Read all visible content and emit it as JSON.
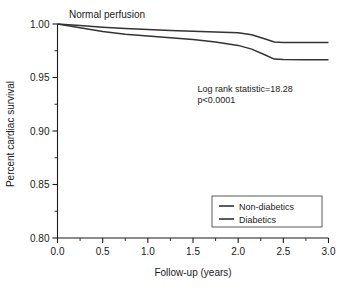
{
  "chart_data": {
    "type": "line",
    "title": "Normal perfusion",
    "xlabel": "Follow-up (years)",
    "ylabel": "Percent cardiac survival",
    "xlim": [
      0.0,
      3.0
    ],
    "ylim": [
      0.8,
      1.0
    ],
    "grid": false,
    "legend_position": "lower right",
    "xticks": [
      0.0,
      0.5,
      1.0,
      1.5,
      2.0,
      2.5,
      3.0
    ],
    "xtick_labels": [
      "0.0",
      "0.5",
      "1.0",
      "1.5",
      "2.0",
      "2.5",
      "3.0"
    ],
    "xminor_ticks": [
      0.25,
      0.75,
      1.25,
      1.75,
      2.25,
      2.75
    ],
    "yticks": [
      0.8,
      0.85,
      0.9,
      0.95,
      1.0
    ],
    "ytick_labels": [
      "0.80",
      "0.85",
      "0.90",
      "0.95",
      "1.00"
    ],
    "yminor_ticks": [
      0.825,
      0.875,
      0.925,
      0.975
    ],
    "series": [
      {
        "name": "Non-diabetics",
        "color": "#333333",
        "x": [
          0.0,
          0.25,
          0.5,
          0.75,
          1.0,
          1.25,
          1.5,
          1.75,
          2.0,
          2.15,
          2.3,
          2.4,
          2.5,
          2.75,
          3.0
        ],
        "values": [
          1.0,
          0.9985,
          0.997,
          0.9958,
          0.9948,
          0.994,
          0.9933,
          0.9926,
          0.9918,
          0.99,
          0.986,
          0.9832,
          0.9828,
          0.9827,
          0.9826
        ]
      },
      {
        "name": "Diabetics",
        "color": "#333333",
        "x": [
          0.0,
          0.25,
          0.5,
          0.75,
          1.0,
          1.25,
          1.5,
          1.75,
          2.0,
          2.15,
          2.3,
          2.4,
          2.5,
          2.75,
          3.0
        ],
        "values": [
          1.0,
          0.9965,
          0.993,
          0.9905,
          0.9888,
          0.9872,
          0.9855,
          0.9832,
          0.98,
          0.9765,
          0.971,
          0.9672,
          0.9668,
          0.9667,
          0.9666
        ]
      }
    ],
    "annotations": [
      {
        "text": "Log rank statistic=18.28",
        "x": 1.55,
        "y": 0.936
      },
      {
        "text": "p<0.0001",
        "x": 1.55,
        "y": 0.9265
      }
    ]
  },
  "legend": {
    "entries": [
      {
        "label": "Non-diabetics"
      },
      {
        "label": "Diabetics"
      }
    ]
  }
}
